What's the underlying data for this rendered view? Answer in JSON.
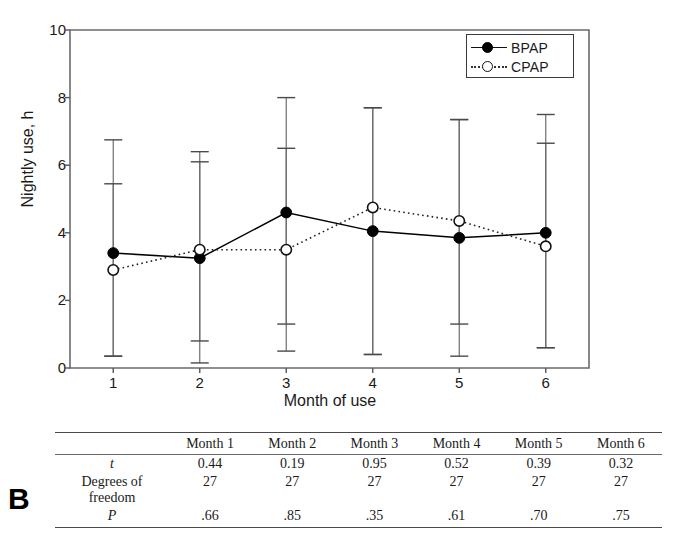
{
  "panel": {
    "letter": "B"
  },
  "chart_data": {
    "type": "line",
    "title": "",
    "xlabel": "Month of use",
    "ylabel": "Nightly use, h",
    "x": [
      1,
      2,
      3,
      4,
      5,
      6
    ],
    "xtick_labels": [
      "1",
      "2",
      "3",
      "4",
      "5",
      "6"
    ],
    "ytick_labels": [
      "0",
      "2",
      "4",
      "6",
      "8",
      "10"
    ],
    "yticks": [
      0,
      2,
      4,
      6,
      8,
      10
    ],
    "ylim": [
      0,
      10
    ],
    "xlim": [
      0.5,
      6.5
    ],
    "grid": false,
    "legend_position": "top-right",
    "series": [
      {
        "name": "BPAP",
        "marker": "filled-circle",
        "line": "solid",
        "color": "#000000",
        "values": [
          3.4,
          3.25,
          4.6,
          4.05,
          3.85,
          4.0
        ],
        "err_upper": [
          6.75,
          6.4,
          8.0,
          7.7,
          7.35,
          7.5
        ],
        "err_lower": [
          0.35,
          0.15,
          0.5,
          0.4,
          0.35,
          0.6
        ]
      },
      {
        "name": "CPAP",
        "marker": "open-circle",
        "line": "dotted",
        "color": "#222222",
        "values": [
          2.9,
          3.5,
          3.5,
          4.75,
          4.35,
          3.6
        ],
        "err_upper": [
          5.45,
          6.1,
          6.5,
          7.7,
          7.35,
          6.65
        ],
        "err_lower": [
          0.35,
          0.8,
          1.3,
          0.4,
          1.3,
          0.6
        ]
      }
    ]
  },
  "stats_table": {
    "corner_label": "",
    "columns": [
      "Month 1",
      "Month 2",
      "Month 3",
      "Month 4",
      "Month 5",
      "Month 6"
    ],
    "rows": [
      {
        "label": "t",
        "label_italic": true,
        "sublabel": "",
        "values": [
          "0.44",
          "0.19",
          "0.95",
          "0.52",
          "0.39",
          "0.32"
        ]
      },
      {
        "label": "Degrees of",
        "label_italic": false,
        "sublabel": "freedom",
        "values": [
          "27",
          "27",
          "27",
          "27",
          "27",
          "27"
        ]
      },
      {
        "label": "P",
        "label_italic": true,
        "sublabel": "",
        "values": [
          ".66",
          ".85",
          ".35",
          ".61",
          ".70",
          ".75"
        ]
      }
    ]
  }
}
